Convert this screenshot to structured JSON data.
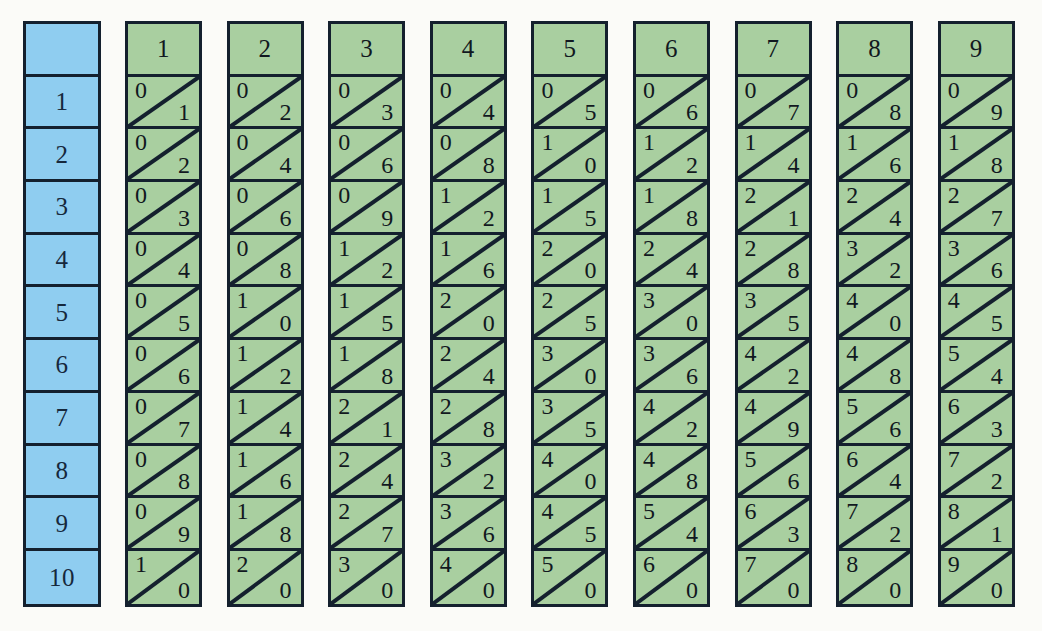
{
  "figure": {
    "kind": "napiers-bones",
    "colors": {
      "index_rod_fill": "#8fcdf0",
      "multiplier_rod_fill": "#a9cfa0",
      "border": "#14202e",
      "digit": "#111820",
      "background": "#fbfbf8"
    }
  },
  "index_rod": {
    "name": "index-rod",
    "header": "",
    "rows": [
      "1",
      "2",
      "3",
      "4",
      "5",
      "6",
      "7",
      "8",
      "9",
      "10"
    ]
  },
  "rods": [
    {
      "header": "1",
      "cells": [
        {
          "tens": "0",
          "units": "1"
        },
        {
          "tens": "0",
          "units": "2"
        },
        {
          "tens": "0",
          "units": "3"
        },
        {
          "tens": "0",
          "units": "4"
        },
        {
          "tens": "0",
          "units": "5"
        },
        {
          "tens": "0",
          "units": "6"
        },
        {
          "tens": "0",
          "units": "7"
        },
        {
          "tens": "0",
          "units": "8"
        },
        {
          "tens": "0",
          "units": "9"
        },
        {
          "tens": "1",
          "units": "0"
        }
      ]
    },
    {
      "header": "2",
      "cells": [
        {
          "tens": "0",
          "units": "2"
        },
        {
          "tens": "0",
          "units": "4"
        },
        {
          "tens": "0",
          "units": "6"
        },
        {
          "tens": "0",
          "units": "8"
        },
        {
          "tens": "1",
          "units": "0"
        },
        {
          "tens": "1",
          "units": "2"
        },
        {
          "tens": "1",
          "units": "4"
        },
        {
          "tens": "1",
          "units": "6"
        },
        {
          "tens": "1",
          "units": "8"
        },
        {
          "tens": "2",
          "units": "0"
        }
      ]
    },
    {
      "header": "3",
      "cells": [
        {
          "tens": "0",
          "units": "3"
        },
        {
          "tens": "0",
          "units": "6"
        },
        {
          "tens": "0",
          "units": "9"
        },
        {
          "tens": "1",
          "units": "2"
        },
        {
          "tens": "1",
          "units": "5"
        },
        {
          "tens": "1",
          "units": "8"
        },
        {
          "tens": "2",
          "units": "1"
        },
        {
          "tens": "2",
          "units": "4"
        },
        {
          "tens": "2",
          "units": "7"
        },
        {
          "tens": "3",
          "units": "0"
        }
      ]
    },
    {
      "header": "4",
      "cells": [
        {
          "tens": "0",
          "units": "4"
        },
        {
          "tens": "0",
          "units": "8"
        },
        {
          "tens": "1",
          "units": "2"
        },
        {
          "tens": "1",
          "units": "6"
        },
        {
          "tens": "2",
          "units": "0"
        },
        {
          "tens": "2",
          "units": "4"
        },
        {
          "tens": "2",
          "units": "8"
        },
        {
          "tens": "3",
          "units": "2"
        },
        {
          "tens": "3",
          "units": "6"
        },
        {
          "tens": "4",
          "units": "0"
        }
      ]
    },
    {
      "header": "5",
      "cells": [
        {
          "tens": "0",
          "units": "5"
        },
        {
          "tens": "1",
          "units": "0"
        },
        {
          "tens": "1",
          "units": "5"
        },
        {
          "tens": "2",
          "units": "0"
        },
        {
          "tens": "2",
          "units": "5"
        },
        {
          "tens": "3",
          "units": "0"
        },
        {
          "tens": "3",
          "units": "5"
        },
        {
          "tens": "4",
          "units": "0"
        },
        {
          "tens": "4",
          "units": "5"
        },
        {
          "tens": "5",
          "units": "0"
        }
      ]
    },
    {
      "header": "6",
      "cells": [
        {
          "tens": "0",
          "units": "6"
        },
        {
          "tens": "1",
          "units": "2"
        },
        {
          "tens": "1",
          "units": "8"
        },
        {
          "tens": "2",
          "units": "4"
        },
        {
          "tens": "3",
          "units": "0"
        },
        {
          "tens": "3",
          "units": "6"
        },
        {
          "tens": "4",
          "units": "2"
        },
        {
          "tens": "4",
          "units": "8"
        },
        {
          "tens": "5",
          "units": "4"
        },
        {
          "tens": "6",
          "units": "0"
        }
      ]
    },
    {
      "header": "7",
      "cells": [
        {
          "tens": "0",
          "units": "7"
        },
        {
          "tens": "1",
          "units": "4"
        },
        {
          "tens": "2",
          "units": "1"
        },
        {
          "tens": "2",
          "units": "8"
        },
        {
          "tens": "3",
          "units": "5"
        },
        {
          "tens": "4",
          "units": "2"
        },
        {
          "tens": "4",
          "units": "9"
        },
        {
          "tens": "5",
          "units": "6"
        },
        {
          "tens": "6",
          "units": "3"
        },
        {
          "tens": "7",
          "units": "0"
        }
      ]
    },
    {
      "header": "8",
      "cells": [
        {
          "tens": "0",
          "units": "8"
        },
        {
          "tens": "1",
          "units": "6"
        },
        {
          "tens": "2",
          "units": "4"
        },
        {
          "tens": "3",
          "units": "2"
        },
        {
          "tens": "4",
          "units": "0"
        },
        {
          "tens": "4",
          "units": "8"
        },
        {
          "tens": "5",
          "units": "6"
        },
        {
          "tens": "6",
          "units": "4"
        },
        {
          "tens": "7",
          "units": "2"
        },
        {
          "tens": "8",
          "units": "0"
        }
      ]
    },
    {
      "header": "9",
      "cells": [
        {
          "tens": "0",
          "units": "9"
        },
        {
          "tens": "1",
          "units": "8"
        },
        {
          "tens": "2",
          "units": "7"
        },
        {
          "tens": "3",
          "units": "6"
        },
        {
          "tens": "4",
          "units": "5"
        },
        {
          "tens": "5",
          "units": "4"
        },
        {
          "tens": "6",
          "units": "3"
        },
        {
          "tens": "7",
          "units": "2"
        },
        {
          "tens": "8",
          "units": "1"
        },
        {
          "tens": "9",
          "units": "0"
        }
      ]
    }
  ],
  "layout": {
    "index_rod_left": 23,
    "index_rod_width": 78,
    "first_rod_left": 125,
    "rod_pitch": 101.6,
    "rod_top": 21,
    "cell_height": 52.7
  }
}
